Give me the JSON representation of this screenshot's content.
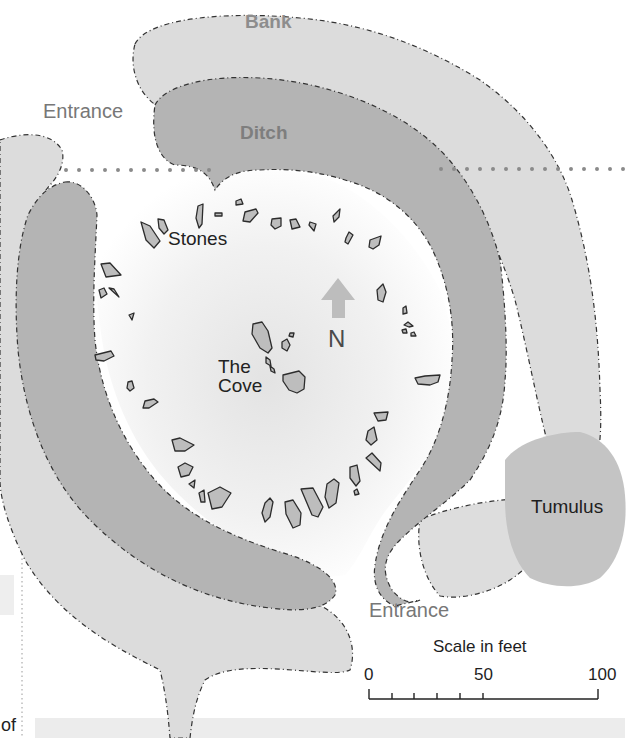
{
  "map": {
    "labels": {
      "bank": "Bank",
      "ditch": "Ditch",
      "entrance_north": "Entrance",
      "entrance_south": "Entrance",
      "stones": "Stones",
      "cove_line1": "The",
      "cove_line2": "Cove",
      "north": "N",
      "tumulus": "Tumulus",
      "fragment_text": "of"
    },
    "scale": {
      "title": "Scale in feet",
      "unit": "feet",
      "ticks": [
        "0",
        "50",
        "100"
      ],
      "minor_tick_count": 5
    },
    "colors": {
      "bank": "#dcdcdc",
      "ditch": "#b4b4b4",
      "interior_center": "#e6e6e6",
      "interior_edge": "#ffffff",
      "stone_fill": "#bdbdbd",
      "stone_stroke": "#2c2c2c",
      "tumulus": "#c4c4c4",
      "north_arrow": "#bdbdbd",
      "dotted_line": "#8a8a8a",
      "footer_band": "#ececec"
    }
  }
}
